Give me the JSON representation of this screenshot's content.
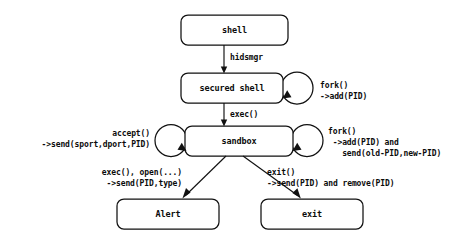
{
  "diagram": {
    "type": "state-flow-diagram",
    "background_color": "#ffffff",
    "stroke_color": "#111111",
    "nodes": [
      {
        "id": "shell",
        "label": "shell",
        "shape": "rounded-rectangle"
      },
      {
        "id": "secured-shell",
        "label": "secured shell",
        "shape": "rounded-rectangle"
      },
      {
        "id": "sandbox",
        "label": "sandbox",
        "shape": "rounded-rectangle"
      },
      {
        "id": "alert",
        "label": "Alert",
        "shape": "rounded-rectangle"
      },
      {
        "id": "exit",
        "label": "exit",
        "shape": "rounded-rectangle"
      }
    ],
    "edges": [
      {
        "id": "shell-to-secured-shell",
        "from": "shell",
        "to": "secured-shell",
        "label": "hidsmgr"
      },
      {
        "id": "secured-shell-self-loop",
        "from": "secured-shell",
        "to": "secured-shell",
        "label_line1": "fork()",
        "label_line2": "->add(PID)"
      },
      {
        "id": "secured-shell-to-sandbox",
        "from": "secured-shell",
        "to": "sandbox",
        "label": "exec()"
      },
      {
        "id": "sandbox-self-loop-left",
        "from": "sandbox",
        "to": "sandbox",
        "label_line1": "accept()",
        "label_line2": "->send(sport,dport,PID)"
      },
      {
        "id": "sandbox-self-loop-right",
        "from": "sandbox",
        "to": "sandbox",
        "label_line1": "fork()",
        "label_line2": " ->add(PID) and",
        "label_line3": "   send(old-PID,new-PID)"
      },
      {
        "id": "sandbox-to-alert",
        "from": "sandbox",
        "to": "alert",
        "label_line1": "exec(), open(...)",
        "label_line2": "->send(PID,type)"
      },
      {
        "id": "sandbox-to-exit",
        "from": "sandbox",
        "to": "exit",
        "label_line1": "exit()",
        "label_line2": "->send(PID) and remove(PID)"
      }
    ]
  }
}
